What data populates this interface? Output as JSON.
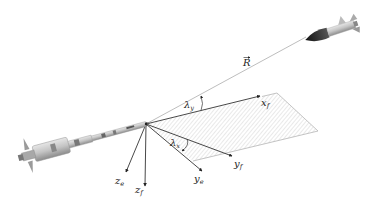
{
  "diagram": {
    "type": "missile-engagement-geometry",
    "labels": {
      "range_vector": "R",
      "lambda_y": "λ",
      "lambda_y_sub": "y",
      "lambda_x": "λ",
      "lambda_x_sub": "x",
      "x_f": "x",
      "x_f_sub": "f",
      "y_f": "y",
      "y_f_sub": "f",
      "y_e": "y",
      "y_e_sub": "e",
      "z_e": "z",
      "z_e_sub": "e",
      "z_f": "z",
      "z_f_sub": "f"
    },
    "elements": [
      "interceptor-missile",
      "target-missile",
      "line-of-sight-vector-R",
      "hatched-plane",
      "x_f-axis",
      "y_f-axis",
      "y_e-axis",
      "z_e-axis",
      "z_f-axis",
      "angle-lambda-y",
      "angle-lambda-x"
    ],
    "colors": {
      "axis": "#333333",
      "los": "#9a9a9a",
      "plane_edge": "#b0b0b0",
      "hatch": "#c8c8c8",
      "missile_body": "#bdbdbd",
      "target_nose": "#2a2a2a"
    }
  }
}
